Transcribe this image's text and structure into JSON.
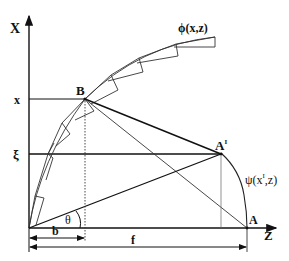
{
  "diagram": {
    "axes": {
      "vertical_label": "X",
      "horizontal_label": "Z"
    },
    "tick_labels": {
      "x": "x",
      "xi": "ξ"
    },
    "points": {
      "B": "B",
      "A": "A",
      "A_prime": "A",
      "A_prime_superscript": "I"
    },
    "curves": {
      "phi": "ϕ(x,z)",
      "psi_prefix": "ψ(x",
      "psi_superscript": "I",
      "psi_suffix": ",z)"
    },
    "angle": "θ",
    "dimensions": {
      "b": "b",
      "f": "f"
    },
    "colors": {
      "line": "#111111",
      "thin_line": "#444444"
    }
  }
}
